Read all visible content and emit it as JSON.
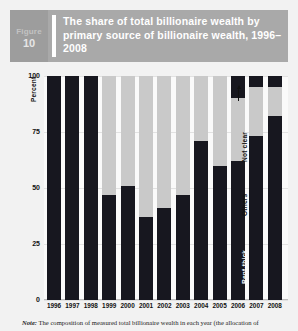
{
  "header": {
    "figure_word": "Figure",
    "figure_number": "10",
    "title": "The share of total billionaire wealth by primary source of billionaire wealth, 1996–2008"
  },
  "note": {
    "prefix": "Note:",
    "text": " The composition of measured total billionaire wealth in each year (the allocation of"
  },
  "colors": {
    "header_band": "#a9a9a9",
    "figure_box": "#9d9d9d",
    "rent_thick": "#17171f",
    "others": "#c9c9c9",
    "not_clear": "#17171f",
    "plot_background": "#fafafa",
    "page_background": "#f2f2f2"
  },
  "annotations": [
    {
      "label": "Rent-thick",
      "style": "light"
    },
    {
      "label": "Others",
      "style": "dark"
    },
    {
      "label": "Not clear",
      "style": "dark"
    }
  ],
  "chart_data": {
    "type": "bar",
    "stacked": true,
    "title": "The share of total billionaire wealth by primary source of billionaire wealth, 1996–2008",
    "xlabel": "",
    "ylabel": "Percent",
    "ylim": [
      0,
      100
    ],
    "yticks": [
      0,
      25,
      50,
      75,
      100
    ],
    "grid": true,
    "legend_position": "in-plot-annotations",
    "categories": [
      "1996",
      "1997",
      "1998",
      "1999",
      "2000",
      "2001",
      "2002",
      "2003",
      "2004",
      "2005",
      "2006",
      "2007",
      "2008"
    ],
    "series": [
      {
        "name": "Rent-thick",
        "values": [
          100,
          100,
          100,
          47,
          51,
          37,
          41,
          47,
          71,
          60,
          62,
          73,
          82
        ]
      },
      {
        "name": "Others",
        "values": [
          0,
          0,
          0,
          53,
          49,
          63,
          59,
          53,
          29,
          40,
          28,
          22,
          13
        ]
      },
      {
        "name": "Not clear",
        "values": [
          0,
          0,
          0,
          0,
          0,
          0,
          0,
          0,
          0,
          0,
          10,
          5,
          5
        ]
      }
    ]
  }
}
